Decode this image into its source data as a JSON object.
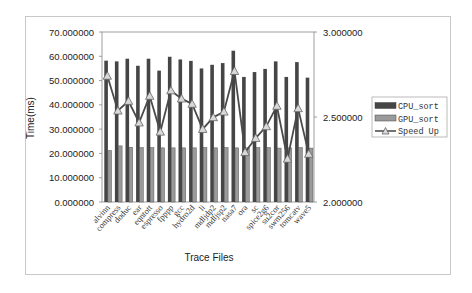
{
  "chart_data": {
    "type": "bar",
    "title": "",
    "xlabel": "Trace Files",
    "ylabel": "Time(ms)",
    "y2label": "",
    "ylim": [
      0,
      70
    ],
    "y2lim": [
      2.0,
      3.0
    ],
    "y_ticks": [
      "0.000000",
      "10.000000",
      "20.000000",
      "30.000000",
      "40.000000",
      "50.000000",
      "60.000000",
      "70.000000"
    ],
    "y2_ticks": [
      "2.000000",
      "2.500000",
      "3.000000"
    ],
    "grid": false,
    "legend_position": "right",
    "categories": [
      "alvinn",
      "compress",
      "doduc",
      "ear",
      "eqntott",
      "espresso",
      "fpppp",
      "gcc",
      "hydro2d",
      "li",
      "mdljdp2",
      "mdljsp2",
      "nasa7",
      "ora",
      "sc",
      "spice2g6",
      "su2cor",
      "swm256",
      "tomcatv",
      "wave5"
    ],
    "series": [
      {
        "name": "CPU_sort",
        "type": "bar",
        "axis": "left",
        "color": "#454545",
        "values": [
          58.2,
          57.9,
          59.0,
          56.1,
          59.0,
          54.1,
          59.8,
          58.7,
          58.1,
          55.0,
          56.5,
          57.2,
          62.3,
          51.5,
          53.5,
          54.8,
          57.9,
          51.5,
          57.6,
          51.2
        ]
      },
      {
        "name": "GPU_sort",
        "type": "bar",
        "axis": "left",
        "color": "#9a9a9a",
        "values": [
          21.2,
          23.1,
          22.5,
          22.4,
          22.4,
          22.3,
          22.3,
          22.3,
          22.3,
          22.4,
          22.3,
          22.4,
          22.3,
          22.3,
          22.4,
          22.4,
          22.2,
          22.3,
          22.4,
          22.2
        ]
      },
      {
        "name": "Speed Up",
        "type": "line",
        "axis": "right",
        "color": "#555555",
        "marker": "triangle",
        "values": [
          2.742,
          2.537,
          2.594,
          2.467,
          2.624,
          2.413,
          2.656,
          2.608,
          2.577,
          2.429,
          2.498,
          2.531,
          2.77,
          2.293,
          2.376,
          2.445,
          2.565,
          2.254,
          2.551,
          2.283
        ]
      }
    ]
  },
  "legend": {
    "items": [
      {
        "label": "CPU_sort",
        "swatch": "bar",
        "color": "#454545"
      },
      {
        "label": "GPU_sort",
        "swatch": "bar",
        "color": "#9a9a9a"
      },
      {
        "label": "Speed Up",
        "swatch": "line-triangle",
        "color": "#555555"
      }
    ]
  }
}
